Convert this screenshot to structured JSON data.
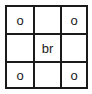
{
  "grid": {
    "rows": 3,
    "cols": 3,
    "cells": [
      [
        "o",
        "",
        "o"
      ],
      [
        "",
        "br",
        ""
      ],
      [
        "o",
        "",
        "o"
      ]
    ]
  }
}
